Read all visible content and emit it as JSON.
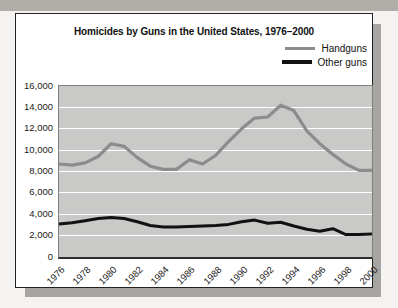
{
  "page": {
    "top_band_color": "#b1aeaa",
    "background_color": "#f4f3f1"
  },
  "card": {
    "background_color": "#ffffff",
    "border_color": "#222222",
    "shadow_color": "#a7a5a1"
  },
  "chart_data": {
    "type": "line",
    "title": "Homicides by Guns in the United States, 1976–2000",
    "x": [
      1976,
      1977,
      1978,
      1979,
      1980,
      1981,
      1982,
      1983,
      1984,
      1985,
      1986,
      1987,
      1988,
      1989,
      1990,
      1991,
      1992,
      1993,
      1994,
      1995,
      1996,
      1997,
      1998,
      1999,
      2000
    ],
    "x_tick_labels": [
      "1976",
      "1978",
      "1980",
      "1982",
      "1984",
      "1986",
      "1988",
      "1990",
      "1992",
      "1994",
      "1996",
      "1998",
      "2000"
    ],
    "ylim": [
      0,
      16000
    ],
    "y_tick_values": [
      16000,
      14000,
      12000,
      10000,
      8000,
      6000,
      4000,
      2000,
      0
    ],
    "y_tick_labels": [
      "16,000",
      "14,000",
      "12,000",
      "10,000",
      "8,000",
      "6,000",
      "4,000",
      "2,000",
      "0"
    ],
    "grid": true,
    "gridline_color": "#ffffff",
    "plot_bg": "#c9c9c7",
    "legend_position": "top-right",
    "series": [
      {
        "name": "Handguns",
        "color": "#8c8c8c",
        "values": [
          8700,
          8600,
          8800,
          9400,
          10600,
          10350,
          9300,
          8500,
          8200,
          8200,
          9100,
          8700,
          9500,
          10800,
          12000,
          13000,
          13100,
          14200,
          13700,
          11800,
          10600,
          9600,
          8700,
          8100,
          8100
        ]
      },
      {
        "name": "Other guns",
        "color": "#111111",
        "values": [
          3100,
          3200,
          3400,
          3600,
          3700,
          3600,
          3300,
          2950,
          2800,
          2800,
          2850,
          2900,
          2950,
          3050,
          3300,
          3450,
          3150,
          3250,
          2900,
          2600,
          2400,
          2650,
          2100,
          2100,
          2150
        ]
      }
    ]
  }
}
